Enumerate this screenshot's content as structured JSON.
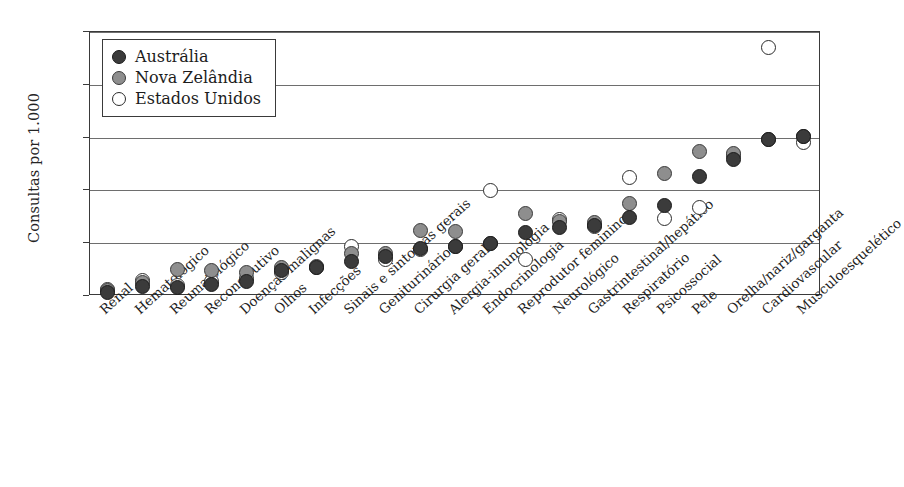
{
  "chart_data": {
    "type": "scatter",
    "title": "",
    "xlabel": "",
    "ylabel": "Consultas por 1.000",
    "ylim": [
      0,
      250
    ],
    "yticks": [
      0,
      50,
      100,
      150,
      200,
      250
    ],
    "ytick_labels": [
      "0",
      "50",
      "100",
      "150",
      "200",
      "250"
    ],
    "grid": "horizontal",
    "legend_position": "top-left",
    "categories": [
      "Renal",
      "Hematológico",
      "Reumatológico",
      "Reconstrutivo",
      "Doenças malignas",
      "Olhos",
      "Infecções",
      "Sinais e sintomas gerais",
      "Geniturinário",
      "Cirurgia geral",
      "Alergia-imunologia",
      "Endocrinologia",
      "Reprodutor feminino",
      "Neurológico",
      "Gastrintestinal/hepático",
      "Respiratório",
      "Psicossocial",
      "Pele",
      "Orelha/nariz/garganta",
      "Cardiovascular",
      "Musculoesquelético"
    ],
    "series": [
      {
        "name": "Austrália",
        "color": "#3b3b3b",
        "marker": "filled-dark-circle",
        "values": [
          3,
          9,
          8,
          11,
          14,
          24,
          27,
          33,
          37,
          45,
          47,
          50,
          60,
          65,
          67,
          74,
          86,
          113,
          129,
          148,
          151
        ]
      },
      {
        "name": "Nova Zelândia",
        "color": "#8e8e8e",
        "marker": "filled-gray-circle",
        "values": [
          5,
          13,
          25,
          24,
          22,
          27,
          28,
          40,
          40,
          62,
          61,
          50,
          78,
          71,
          70,
          88,
          116,
          137,
          135,
          148,
          151
        ]
      },
      {
        "name": "Estados Unidos",
        "color": "#ffffff",
        "marker": "open-circle",
        "values": [
          6,
          15,
          10,
          14,
          17,
          22,
          27,
          47,
          35,
          44,
          47,
          100,
          35,
          72,
          66,
          112,
          73,
          84,
          133,
          235,
          145
        ]
      }
    ]
  },
  "legend": {
    "items": [
      {
        "label": "Austrália",
        "kind": "au"
      },
      {
        "label": "Nova Zelândia",
        "kind": "nz"
      },
      {
        "label": "Estados Unidos",
        "kind": "us"
      }
    ]
  }
}
